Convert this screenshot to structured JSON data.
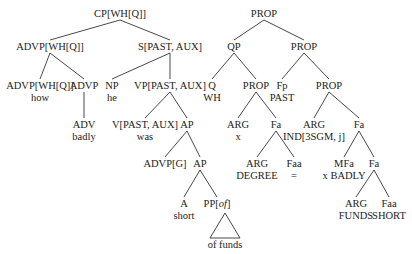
{
  "figure": {
    "type": "tree-diagram-pair",
    "trees": [
      {
        "name": "syntactic-tree",
        "nodes": [
          {
            "id": "cp",
            "label": "CP[WH[Q]]"
          },
          {
            "id": "advp1",
            "label": "ADVP[WH[Q]]",
            "parent": "cp"
          },
          {
            "id": "s",
            "label": "S[PAST, AUX]",
            "parent": "cp"
          },
          {
            "id": "advp2",
            "label": "ADVP[WH[Q]]",
            "word": "how",
            "parent": "advp1"
          },
          {
            "id": "advp3",
            "label": "ADVP",
            "parent": "advp1"
          },
          {
            "id": "np",
            "label": "NP",
            "word": "he",
            "parent": "s"
          },
          {
            "id": "vp",
            "label": "VP[PAST, AUX]",
            "parent": "s"
          },
          {
            "id": "adv",
            "label": "ADV",
            "word": "badly",
            "parent": "advp3"
          },
          {
            "id": "v",
            "label": "V[PAST, AUX]",
            "word": "was",
            "parent": "vp"
          },
          {
            "id": "ap1",
            "label": "AP",
            "parent": "vp"
          },
          {
            "id": "advpg",
            "label": "ADVP[G]",
            "parent": "ap1"
          },
          {
            "id": "ap2",
            "label": "AP",
            "parent": "ap1"
          },
          {
            "id": "a",
            "label": "A",
            "word": "short",
            "parent": "ap2"
          },
          {
            "id": "pp",
            "label": "PP[of]",
            "label_main": "PP[",
            "label_italic": "of",
            "label_end": "]",
            "word": "of funds",
            "triangle": true,
            "parent": "ap2"
          }
        ]
      },
      {
        "name": "semantic-tree",
        "nodes": [
          {
            "id": "prop0",
            "label": "PROP"
          },
          {
            "id": "qp",
            "label": "QP",
            "parent": "prop0"
          },
          {
            "id": "prop1",
            "label": "PROP",
            "parent": "prop0"
          },
          {
            "id": "q",
            "label": "Q",
            "word": "WH",
            "parent": "qp"
          },
          {
            "id": "prop2",
            "label": "PROP",
            "parent": "qp"
          },
          {
            "id": "fp",
            "label": "Fp",
            "word": "PAST",
            "parent": "prop1"
          },
          {
            "id": "prop3",
            "label": "PROP",
            "parent": "prop1"
          },
          {
            "id": "arg1",
            "label": "ARG",
            "word": "x",
            "parent": "prop2"
          },
          {
            "id": "fa1",
            "label": "Fa",
            "parent": "prop2"
          },
          {
            "id": "arg2",
            "label": "ARG",
            "word": "IND[3SGM, j]",
            "parent": "prop3"
          },
          {
            "id": "fa2",
            "label": "Fa",
            "parent": "prop3"
          },
          {
            "id": "arg3",
            "label": "ARG",
            "word": "DEGREE",
            "parent": "fa1"
          },
          {
            "id": "faa1",
            "label": "Faa",
            "word": "=",
            "parent": "fa1"
          },
          {
            "id": "mfa",
            "label": "MFa",
            "word": "x BADLY",
            "parent": "fa2"
          },
          {
            "id": "fa3",
            "label": "Fa",
            "parent": "fa2"
          },
          {
            "id": "arg4",
            "label": "ARG",
            "word": "FUNDS",
            "parent": "fa3"
          },
          {
            "id": "faa2",
            "label": "Faa",
            "word": "SHORT",
            "parent": "fa3"
          }
        ]
      }
    ]
  }
}
